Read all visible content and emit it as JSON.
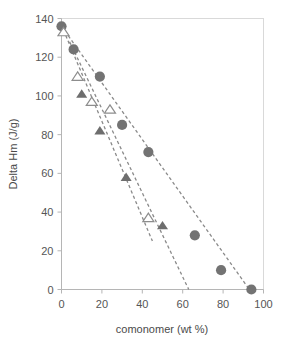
{
  "chart_data": {
    "type": "scatter",
    "title": "",
    "subtitle": "",
    "xlabel": "comonomer (wt %)",
    "ylabel": "Delta Hm (J/g)",
    "xlim": [
      0,
      100
    ],
    "ylim": [
      0,
      140
    ],
    "xticks": [
      0,
      20,
      40,
      60,
      80,
      100
    ],
    "yticks": [
      0,
      20,
      40,
      60,
      80,
      100,
      120,
      140
    ],
    "xtick_labels": [
      "0",
      "20",
      "40",
      "60",
      "80",
      "100"
    ],
    "ytick_labels": [
      "0",
      "20",
      "40",
      "60",
      "80",
      "100",
      "120",
      "140"
    ],
    "grid": false,
    "legend": null,
    "legend_position": "none",
    "series": [
      {
        "name": "filled-circles",
        "marker": "circle",
        "marker_fill": "#737373",
        "marker_style": "filled",
        "points": [
          {
            "x": 0,
            "y": 136
          },
          {
            "x": 6,
            "y": 124
          },
          {
            "x": 19,
            "y": 110
          },
          {
            "x": 30,
            "y": 85
          },
          {
            "x": 43,
            "y": 71
          },
          {
            "x": 66,
            "y": 28
          },
          {
            "x": 79,
            "y": 10
          },
          {
            "x": 94,
            "y": 0
          }
        ]
      },
      {
        "name": "filled-triangles",
        "marker": "triangle",
        "marker_fill": "#6e6e6e",
        "marker_style": "filled",
        "points": [
          {
            "x": 10,
            "y": 101
          },
          {
            "x": 19,
            "y": 82
          },
          {
            "x": 32,
            "y": 58
          },
          {
            "x": 50,
            "y": 33
          }
        ]
      },
      {
        "name": "open-triangles",
        "marker": "triangle",
        "marker_fill": "#ffffff",
        "marker_style": "open",
        "points": [
          {
            "x": 1,
            "y": 133
          },
          {
            "x": 8,
            "y": 110
          },
          {
            "x": 15,
            "y": 97
          },
          {
            "x": 24,
            "y": 93
          },
          {
            "x": 43,
            "y": 37
          }
        ]
      }
    ],
    "trendlines": [
      {
        "name": "trend-circles",
        "style": "dashed",
        "color": "#8a8a8a",
        "x_start": 0,
        "y_start": 136,
        "x_end": 93,
        "y_end": 0
      },
      {
        "name": "trend-open-triangles",
        "style": "dashed",
        "color": "#8a8a8a",
        "x_start": 1,
        "y_start": 134,
        "x_end": 45,
        "y_end": 25
      },
      {
        "name": "trend-filled-triangles",
        "style": "dashed",
        "color": "#8a8a8a",
        "x_start": 4,
        "y_start": 128,
        "x_end": 63,
        "y_end": 0
      }
    ],
    "annotations": []
  },
  "colors": {
    "marker_fill": "#737373",
    "marker_open_stroke": "#8d8d8d",
    "trendline": "#8a8a8a",
    "axis": "#b5b5b5",
    "frame": "#d9d9d9",
    "text": "#4a4a4a",
    "background": "#ffffff"
  }
}
